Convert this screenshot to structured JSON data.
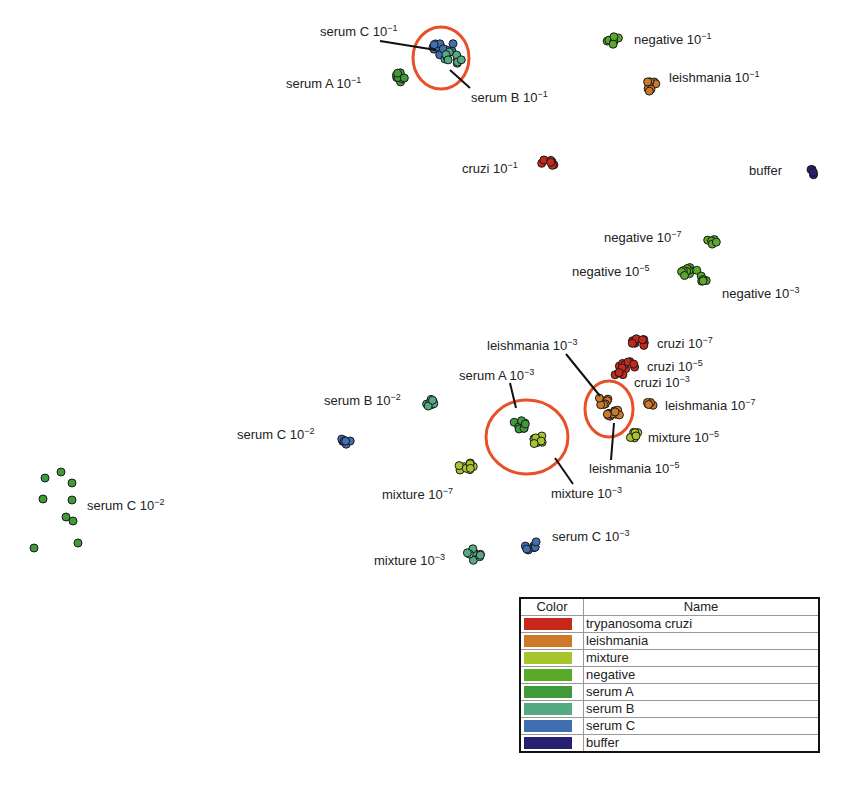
{
  "chart_data": {
    "type": "scatter",
    "title": "",
    "xlabel": "",
    "ylabel": "",
    "grid": false,
    "legend_position": "bottom-right",
    "legend": {
      "headers": [
        "Color",
        "Name"
      ],
      "entries": [
        {
          "name": "trypanosoma cruzi",
          "color": "#c8281c"
        },
        {
          "name": "leishmania",
          "color": "#cc7a2a"
        },
        {
          "name": "mixture",
          "color": "#a8c42e"
        },
        {
          "name": "negative",
          "color": "#5aaa2a"
        },
        {
          "name": "serum A",
          "color": "#3f9a3a"
        },
        {
          "name": "serum B",
          "color": "#56aa82"
        },
        {
          "name": "serum C",
          "color": "#3f6fb0"
        },
        {
          "name": "buffer",
          "color": "#252070"
        }
      ]
    },
    "clusters": [
      {
        "label": "serum C",
        "exp": "−1",
        "group": "serum C",
        "cx": 442,
        "cy": 47,
        "n": 12,
        "spread": 12
      },
      {
        "label": "serum B",
        "exp": "−1",
        "group": "serum B",
        "cx": 452,
        "cy": 56,
        "n": 10,
        "spread": 11
      },
      {
        "label": "serum A",
        "exp": "−1",
        "group": "serum A",
        "cx": 400,
        "cy": 77,
        "n": 8,
        "spread": 7
      },
      {
        "label": "negative",
        "exp": "−1",
        "group": "negative",
        "cx": 614,
        "cy": 39,
        "n": 7,
        "spread": 8
      },
      {
        "label": "leishmania",
        "exp": "−1",
        "group": "leishmania",
        "cx": 650,
        "cy": 86,
        "n": 8,
        "spread": 7
      },
      {
        "label": "cruzi",
        "exp": "−1",
        "group": "trypanosoma cruzi",
        "cx": 548,
        "cy": 162,
        "n": 8,
        "spread": 7
      },
      {
        "label": "buffer",
        "exp": "",
        "group": "buffer",
        "cx": 813,
        "cy": 172,
        "n": 4,
        "spread": 4
      },
      {
        "label": "negative",
        "exp": "−7",
        "group": "negative",
        "cx": 713,
        "cy": 241,
        "n": 6,
        "spread": 6
      },
      {
        "label": "negative",
        "exp": "−5",
        "group": "negative",
        "cx": 689,
        "cy": 270,
        "n": 9,
        "spread": 9
      },
      {
        "label": "negative",
        "exp": "−3",
        "group": "negative",
        "cx": 702,
        "cy": 279,
        "n": 5,
        "spread": 5
      },
      {
        "label": "cruzi",
        "exp": "−7",
        "group": "trypanosoma cruzi",
        "cx": 639,
        "cy": 342,
        "n": 9,
        "spread": 7
      },
      {
        "label": "cruzi",
        "exp": "−5",
        "group": "trypanosoma cruzi",
        "cx": 628,
        "cy": 368,
        "n": 10,
        "spread": 9
      },
      {
        "label": "cruzi",
        "exp": "−3",
        "group": "trypanosoma cruzi",
        "cx": 620,
        "cy": 374,
        "n": 4,
        "spread": 5
      },
      {
        "label": "leishmania",
        "exp": "−3",
        "group": "leishmania",
        "cx": 603,
        "cy": 400,
        "n": 8,
        "spread": 7
      },
      {
        "label": "leishmania",
        "exp": "−5",
        "group": "leishmania",
        "cx": 613,
        "cy": 413,
        "n": 10,
        "spread": 8
      },
      {
        "label": "leishmania",
        "exp": "−7",
        "group": "leishmania",
        "cx": 650,
        "cy": 403,
        "n": 6,
        "spread": 5
      },
      {
        "label": "mixture",
        "exp": "−5",
        "group": "mixture",
        "cx": 634,
        "cy": 435,
        "n": 6,
        "spread": 5
      },
      {
        "label": "serum A",
        "exp": "−3",
        "group": "serum A",
        "cx": 520,
        "cy": 425,
        "n": 9,
        "spread": 7
      },
      {
        "label": "mixture",
        "exp": "−3",
        "group": "mixture",
        "cx": 539,
        "cy": 440,
        "n": 8,
        "spread": 7
      },
      {
        "label": "serum B",
        "exp": "−2",
        "group": "serum B",
        "cx": 431,
        "cy": 403,
        "n": 8,
        "spread": 5
      },
      {
        "label": "serum C",
        "exp": "−2",
        "group": "serum C",
        "cx": 346,
        "cy": 441,
        "n": 9,
        "spread": 6
      },
      {
        "label": "mixture",
        "exp": "−7",
        "group": "mixture",
        "cx": 466,
        "cy": 468,
        "n": 9,
        "spread": 8
      },
      {
        "label": "serum C",
        "exp": "−2",
        "group": "serum A",
        "cx": 57,
        "cy": 506,
        "n": 9,
        "spread": 0,
        "scattered": true
      },
      {
        "label": "mixture",
        "exp": "−3",
        "group": "serum B",
        "cx": 476,
        "cy": 554,
        "n": 10,
        "spread": 9
      },
      {
        "label": "serum C",
        "exp": "−3",
        "group": "serum C",
        "cx": 531,
        "cy": 545,
        "n": 9,
        "spread": 8
      }
    ],
    "highlights": [
      {
        "shape": "circle",
        "cx": 441,
        "cy": 58,
        "rx": 28,
        "ry": 31,
        "color": "#e8502a"
      },
      {
        "shape": "ellipse",
        "cx": 527,
        "cy": 437,
        "rx": 41,
        "ry": 37,
        "color": "#e8502a"
      },
      {
        "shape": "circle",
        "cx": 609,
        "cy": 409,
        "rx": 24,
        "ry": 28,
        "color": "#e8502a"
      }
    ]
  },
  "labels": [
    {
      "text": "serum C 10",
      "sup": "−1",
      "x": 320,
      "y": 36
    },
    {
      "text": "serum A 10",
      "sup": "−1",
      "x": 286,
      "y": 88
    },
    {
      "text": "serum B 10",
      "sup": "−1",
      "x": 471,
      "y": 102
    },
    {
      "text": "negative 10",
      "sup": "−1",
      "x": 634,
      "y": 44
    },
    {
      "text": "leishmania 10",
      "sup": "−1",
      "x": 669,
      "y": 82
    },
    {
      "text": "cruzi 10",
      "sup": "−1",
      "x": 462,
      "y": 173
    },
    {
      "text": "buffer",
      "sup": "",
      "x": 749,
      "y": 175
    },
    {
      "text": "negative 10",
      "sup": "−7",
      "x": 604,
      "y": 242
    },
    {
      "text": "negative 10",
      "sup": "−5",
      "x": 572,
      "y": 276
    },
    {
      "text": "negative 10",
      "sup": "−3",
      "x": 722,
      "y": 298
    },
    {
      "text": "leishmania 10",
      "sup": "−3",
      "x": 487,
      "y": 350
    },
    {
      "text": "cruzi 10",
      "sup": "−7",
      "x": 657,
      "y": 348
    },
    {
      "text": "cruzi 10",
      "sup": "−5",
      "x": 647,
      "y": 371
    },
    {
      "text": "cruzi 10",
      "sup": "−3",
      "x": 634,
      "y": 387
    },
    {
      "text": "serum A 10",
      "sup": "−3",
      "x": 459,
      "y": 380
    },
    {
      "text": "leishmania 10",
      "sup": "−7",
      "x": 665,
      "y": 410
    },
    {
      "text": "serum B 10",
      "sup": "−2",
      "x": 324,
      "y": 405
    },
    {
      "text": "serum C 10",
      "sup": "−2",
      "x": 237,
      "y": 439
    },
    {
      "text": "mixture 10",
      "sup": "−5",
      "x": 648,
      "y": 442
    },
    {
      "text": "leishmania 10",
      "sup": "−5",
      "x": 589,
      "y": 473
    },
    {
      "text": "mixture 10",
      "sup": "−7",
      "x": 382,
      "y": 499
    },
    {
      "text": "mixture 10",
      "sup": "−3",
      "x": 551,
      "y": 498
    },
    {
      "text": "serum C 10",
      "sup": "−2",
      "x": 87,
      "y": 510
    },
    {
      "text": "serum C 10",
      "sup": "−3",
      "x": 552,
      "y": 541
    },
    {
      "text": "mixture 10",
      "sup": "−3",
      "x": 374,
      "y": 565
    }
  ],
  "leaders": [
    {
      "x1": 380,
      "y1": 41,
      "x2": 436,
      "y2": 50
    },
    {
      "x1": 450,
      "y1": 70,
      "x2": 470,
      "y2": 88
    },
    {
      "x1": 510,
      "y1": 383,
      "x2": 516,
      "y2": 408
    },
    {
      "x1": 566,
      "y1": 354,
      "x2": 600,
      "y2": 396
    },
    {
      "x1": 555,
      "y1": 458,
      "x2": 573,
      "y2": 484
    },
    {
      "x1": 614,
      "y1": 423,
      "x2": 611,
      "y2": 460
    }
  ]
}
